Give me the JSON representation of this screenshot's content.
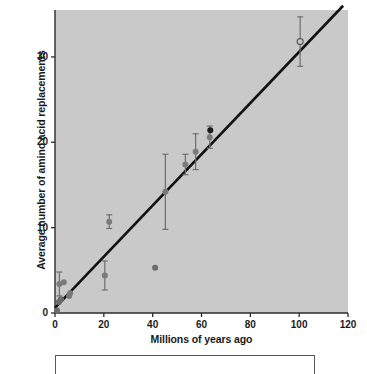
{
  "figure": {
    "background": "#ffffff",
    "plot_background": "#c9c9c9",
    "caption_box_text": ""
  },
  "chart_data": {
    "type": "scatter",
    "title": "",
    "xlabel": "Millions of years ago",
    "ylabel": "Average number of amino acid replacements",
    "xlim": [
      0,
      120
    ],
    "ylim": [
      0,
      35.5
    ],
    "xticks": [
      0,
      20,
      40,
      60,
      80,
      100,
      120
    ],
    "xticklabels": [
      "0",
      "20",
      "40",
      "60",
      "80",
      "100",
      "120"
    ],
    "yticks": [
      0,
      10,
      20,
      30
    ],
    "yticklabels": [
      "0",
      "10",
      "20",
      "30"
    ],
    "grid": false,
    "legend": null,
    "marker_color": "#7a7a7a",
    "highlight_marker_color": "#1a1a1a",
    "line_color": "#111111",
    "errorbar_color": "#6e6e6e",
    "trendline": {
      "type": "linear",
      "x": [
        0,
        118
      ],
      "y": [
        0.6,
        36.0
      ],
      "slope": 0.3,
      "intercept": 0.6
    },
    "points": [
      {
        "x": 0.8,
        "y": 0.3,
        "yerr": 0.0,
        "style": "filled",
        "color": "#6b6b6b"
      },
      {
        "x": 1.6,
        "y": 1.3,
        "yerr": 0.0,
        "style": "filled",
        "color": "#6b6b6b"
      },
      {
        "x": 1.8,
        "y": 3.4,
        "yerr": 1.4,
        "style": "filled",
        "color": "#7a7a7a"
      },
      {
        "x": 2.4,
        "y": 1.6,
        "yerr": 0.0,
        "style": "filled",
        "color": "#6b6b6b"
      },
      {
        "x": 3.6,
        "y": 3.6,
        "yerr": 0.0,
        "style": "filled",
        "color": "#7a7a7a"
      },
      {
        "x": 5.8,
        "y": 2.0,
        "yerr": 0.0,
        "style": "filled",
        "color": "#7a7a7a"
      },
      {
        "x": 6.2,
        "y": 2.3,
        "yerr": 0.0,
        "style": "filled",
        "color": "#7a7a7a"
      },
      {
        "x": 20.4,
        "y": 4.4,
        "yerr": 1.7,
        "style": "filled",
        "color": "#7a7a7a"
      },
      {
        "x": 22.2,
        "y": 10.7,
        "yerr": 0.8,
        "style": "filled",
        "color": "#7a7a7a"
      },
      {
        "x": 41.0,
        "y": 5.3,
        "yerr": 0.0,
        "style": "filled",
        "color": "#6b6b6b"
      },
      {
        "x": 45.2,
        "y": 14.2,
        "yerr": 4.4,
        "style": "filled",
        "color": "#7a7a7a"
      },
      {
        "x": 53.4,
        "y": 17.4,
        "yerr": 1.2,
        "style": "filled",
        "color": "#7a7a7a"
      },
      {
        "x": 57.6,
        "y": 18.9,
        "yerr": 2.1,
        "style": "filled",
        "color": "#7a7a7a"
      },
      {
        "x": 63.4,
        "y": 20.6,
        "yerr": 1.3,
        "style": "filled",
        "color": "#7a7a7a"
      },
      {
        "x": 63.6,
        "y": 21.4,
        "yerr": 0.0,
        "style": "filled",
        "color": "#1a1a1a"
      },
      {
        "x": 100.4,
        "y": 31.8,
        "yerr": 2.9,
        "style": "open",
        "color": "#5a5a5a"
      }
    ]
  }
}
